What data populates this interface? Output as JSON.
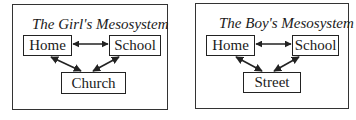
{
  "diagrams": [
    {
      "title": "The Girl's Mesosystem",
      "nodes": {
        "top_left": "Home",
        "top_right": "School",
        "bottom": "Church"
      },
      "edges": [
        {
          "from": "Home",
          "to": "School",
          "type": "bidirectional"
        },
        {
          "from": "Home",
          "to": "Church",
          "type": "bidirectional"
        },
        {
          "from": "School",
          "to": "Church",
          "type": "bidirectional"
        }
      ]
    },
    {
      "title": "The Boy's Mesosystem",
      "nodes": {
        "top_left": "Home",
        "top_right": "School",
        "bottom": "Street"
      },
      "edges": [
        {
          "from": "Home",
          "to": "School",
          "type": "bidirectional"
        },
        {
          "from": "Home",
          "to": "Street",
          "type": "bidirectional"
        },
        {
          "from": "School",
          "to": "Street",
          "type": "bidirectional"
        }
      ]
    }
  ],
  "colors": {
    "stroke": "#222222",
    "background": "#ffffff"
  }
}
